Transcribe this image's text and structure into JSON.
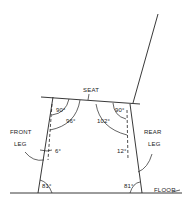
{
  "diagram": {
    "type": "chair-angle-diagram",
    "labels": {
      "seat": "SEAT",
      "front_leg_line1": "FRONT",
      "front_leg_line2": "LEG",
      "rear_leg_line1": "REAR",
      "rear_leg_line2": "LEG",
      "floor": "FLOOR"
    },
    "angles": {
      "front_seat_leg": "90°",
      "front_seat_to_vertical": "96°",
      "rear_seat_to_vertical": "102°",
      "rear_seat_leg": "90°",
      "front_leg_splay": "6°",
      "rear_leg_splay": "12°",
      "front_floor": "81°",
      "rear_floor": "81°"
    }
  }
}
